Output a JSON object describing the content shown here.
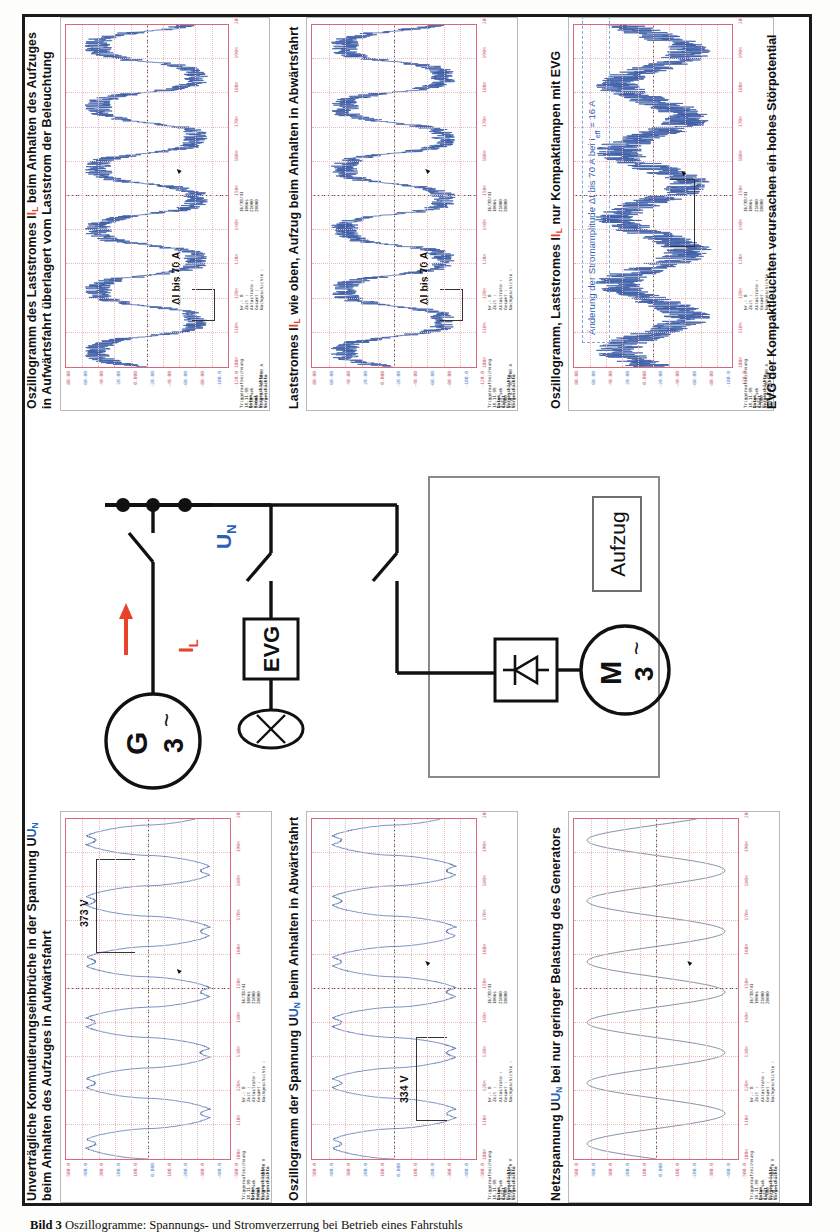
{
  "figure": {
    "page_caption_prefix": "Bild 3",
    "page_caption": "Oszillogramme: Spannungs- und Stromverzerrung bei Betrieb eines Fahrstuhls"
  },
  "panels": [
    {
      "id": "panel-un-aufwaerts",
      "caption_line1": "Unverträgliche Kommutierungseinbrüche in der Spannung U",
      "caption_sub1": "N",
      "caption_line2": "beim Anhalten des Aufzuges in Aufwärtsfahrt",
      "annotation": "373 V",
      "signal": "voltage",
      "noisy": false
    },
    {
      "id": "panel-un-abwaerts",
      "caption_line1": "Oszillogramm der Spannung U",
      "caption_sub1": "N",
      "caption_line2": " beim Anhalten in Abwärtsfahrt",
      "annotation": "334 V",
      "signal": "voltage",
      "noisy": false
    },
    {
      "id": "panel-un-generator",
      "caption_line1": "Netzspannung U",
      "caption_sub1": "N",
      "caption_line2": " bei nur geringer Belastung des Generators",
      "annotation": "",
      "signal": "voltage-clean",
      "noisy": false
    },
    {
      "id": "panel-il-aufwaerts",
      "caption_line1": "Oszillogramm des Laststromes I",
      "caption_sub1": "L",
      "caption_line2": " beim Anhalten des Aufzuges",
      "caption_line3": "in Aufwärtsfahrt überlagert vom Laststrom der Beleuchtung",
      "annotation": "ΔI bis 70 A",
      "signal": "current",
      "noisy": true
    },
    {
      "id": "panel-il-abwaerts",
      "caption_line1": "Laststromes I",
      "caption_sub1": "L",
      "caption_line2": " wie oben, Aufzug beim Anhalten in Abwärtsfahrt",
      "annotation": "ΔI bis 70 A",
      "signal": "current",
      "noisy": true
    },
    {
      "id": "panel-il-evg",
      "caption_line1": "Oszillogramm, Laststromes I",
      "caption_sub1": "L",
      "caption_line2": " nur Kompaktlampen mit EVG",
      "annotation": "Änderung der Stromamplitude ΔI bis 70 A bei I",
      "annotation_sub": "eff",
      "annotation_tail": " = 16 A",
      "signal": "current-hf",
      "noisy": true
    }
  ],
  "footnote": "EVG der Kompaktleuchten verursachen ein hohes Störpotential",
  "scope_labels": {
    "yaxis_voltage": [
      "500.0",
      "400.0",
      "300.0",
      "200.0",
      "100.0",
      "0.000",
      "-100.0",
      "-200.0",
      "-300.0",
      "-400.0",
      "-500.0"
    ],
    "yaxis_current": [
      "80.00",
      "60.00",
      "40.00",
      "20.00",
      "0.000",
      "-20.00",
      "-40.00",
      "-60.00",
      "-80.00",
      "-100.0",
      "-120.0"
    ],
    "xaxis": [
      "100m",
      "110m",
      "120m",
      "130m",
      "140m",
      "150m",
      "160m",
      "170m",
      "180m",
      "190m",
      "200m"
    ],
    "params_left_title": "Triggeraufzeichnung",
    "params_left_rows": [
      "18.11.99",
      "5.23 sek",
      "2.000"
    ],
    "params_left_unit_v": "Eing  V : 380.0 V",
    "params_left_unit_a": "Eing  A : 0.1000 A",
    "params_mid_rows": [
      "Nr.:        8",
      "Zeit         :",
      "Abtastrate   :",
      "Gesamt       :",
      "Nachgeschichte :"
    ],
    "params_right_rows": [
      "16/38/41",
      "100ms",
      "21000",
      "20000"
    ],
    "params_footer_left": [
      "Datum",
      "Kanal",
      "Vorgeschichte",
      "Vorgeschichte"
    ]
  },
  "circuit": {
    "generator_label_top": "G",
    "generator_label_bottom": "3",
    "generator_tilde": "~",
    "motor_label_top": "M",
    "motor_label_bottom": "3",
    "motor_tilde": "~",
    "current_label": "I",
    "current_label_sub": "L",
    "voltage_label": "U",
    "voltage_label_sub": "N",
    "ballast_label": "EVG",
    "lift_label": "Aufzug",
    "accent_red": "#e8432a",
    "accent_blue": "#2b62b5"
  }
}
